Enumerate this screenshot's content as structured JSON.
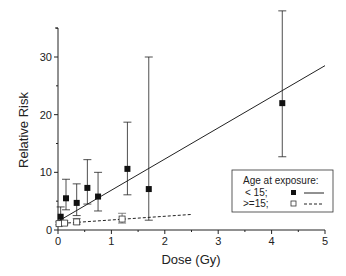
{
  "chart_data": {
    "type": "scatter",
    "title": "",
    "xlabel": "Dose (Gy)",
    "ylabel": "Relative Risk",
    "xlim": [
      0,
      5
    ],
    "ylim": [
      0,
      35
    ],
    "xticks": [
      0,
      1,
      2,
      3,
      4,
      5
    ],
    "yticks": [
      0,
      10,
      20,
      30
    ],
    "grid": false,
    "legend": {
      "title": "Age at exposure:",
      "position": "lower right",
      "entries": [
        {
          "label": "< 15;",
          "marker": "filled-square",
          "line": "solid"
        },
        {
          "label": ">=15;",
          "marker": "open-square",
          "line": "dashed"
        }
      ]
    },
    "series": [
      {
        "name": "< 15",
        "marker": "filled-square",
        "points": [
          {
            "x": 0.05,
            "y": 2.3,
            "lo": 1.2,
            "hi": 4.0
          },
          {
            "x": 0.15,
            "y": 5.5,
            "lo": 3.5,
            "hi": 8.8
          },
          {
            "x": 0.35,
            "y": 4.7,
            "lo": 2.5,
            "hi": 8.0
          },
          {
            "x": 0.55,
            "y": 7.3,
            "lo": 4.5,
            "hi": 12.2
          },
          {
            "x": 0.75,
            "y": 5.8,
            "lo": 3.3,
            "hi": 10.0
          },
          {
            "x": 1.3,
            "y": 10.6,
            "lo": 6.1,
            "hi": 18.7
          },
          {
            "x": 1.7,
            "y": 7.1,
            "lo": 1.7,
            "hi": 30.0
          },
          {
            "x": 4.2,
            "y": 22.0,
            "lo": 12.7,
            "hi": 38.0
          }
        ],
        "fit_line": {
          "style": "solid",
          "x": [
            0,
            5
          ],
          "y": [
            1.5,
            28.5
          ]
        }
      },
      {
        "name": ">=15",
        "marker": "open-square",
        "points": [
          {
            "x": 0.02,
            "y": 1.1,
            "lo": 0.9,
            "hi": 1.4
          },
          {
            "x": 0.12,
            "y": 1.2,
            "lo": 0.9,
            "hi": 1.6
          },
          {
            "x": 0.35,
            "y": 1.4,
            "lo": 1.0,
            "hi": 2.0
          },
          {
            "x": 1.2,
            "y": 1.9,
            "lo": 1.2,
            "hi": 2.9
          }
        ],
        "fit_line": {
          "style": "dashed",
          "x": [
            0,
            2.5
          ],
          "y": [
            1.1,
            2.7
          ]
        }
      }
    ]
  }
}
